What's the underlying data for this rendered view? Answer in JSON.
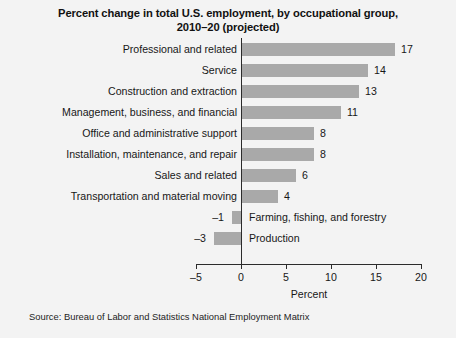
{
  "chart_data": {
    "type": "bar",
    "orientation": "horizontal",
    "title": "Percent change in total U.S. employment, by occupational group, 2010–20 (projected)",
    "title_line1": "Percent change in total U.S. employment, by occupational group,",
    "title_line2": "2010–20 (projected)",
    "xlabel": "Percent",
    "ylabel": "",
    "xlim": [
      -5,
      20
    ],
    "xticks": [
      -5,
      0,
      5,
      10,
      15,
      20
    ],
    "xtick_labels": [
      "–5",
      "0",
      "5",
      "10",
      "15",
      "20"
    ],
    "grid": false,
    "legend": false,
    "bar_color": "#a9a9a9",
    "categories": [
      "Professional and related",
      "Service",
      "Construction and extraction",
      "Management, business, and financial",
      "Office and administrative support",
      "Installation, maintenance, and repair",
      "Sales and related",
      "Transportation and material moving",
      "Farming, fishing, and forestry",
      "Production"
    ],
    "values": [
      17,
      14,
      13,
      11,
      8,
      8,
      6,
      4,
      -1,
      -3
    ],
    "value_labels": [
      "17",
      "14",
      "13",
      "11",
      "8",
      "8",
      "6",
      "4",
      "–1",
      "–3"
    ],
    "source": "Source: Bureau of Labor and Statistics National Employment Matrix"
  },
  "rows": [
    {
      "label": "Professional and related",
      "value": 17,
      "value_label": "17",
      "label_side": "left",
      "sign": "pos"
    },
    {
      "label": "Service",
      "value": 14,
      "value_label": "14",
      "label_side": "left",
      "sign": "pos"
    },
    {
      "label": "Construction and extraction",
      "value": 13,
      "value_label": "13",
      "label_side": "left",
      "sign": "pos"
    },
    {
      "label": "Management, business, and financial",
      "value": 11,
      "value_label": "11",
      "label_side": "left",
      "sign": "pos"
    },
    {
      "label": "Office and administrative support",
      "value": 8,
      "value_label": "8",
      "label_side": "left",
      "sign": "pos"
    },
    {
      "label": "Installation, maintenance, and repair",
      "value": 8,
      "value_label": "8",
      "label_side": "left",
      "sign": "pos"
    },
    {
      "label": "Sales and related",
      "value": 6,
      "value_label": "6",
      "label_side": "left",
      "sign": "pos"
    },
    {
      "label": "Transportation and material moving",
      "value": 4,
      "value_label": "4",
      "label_side": "left",
      "sign": "pos"
    },
    {
      "label": "Farming, fishing, and forestry",
      "value": -1,
      "value_label": "–1",
      "label_side": "right",
      "sign": "neg"
    },
    {
      "label": "Production",
      "value": -3,
      "value_label": "–3",
      "label_side": "right",
      "sign": "neg"
    }
  ]
}
